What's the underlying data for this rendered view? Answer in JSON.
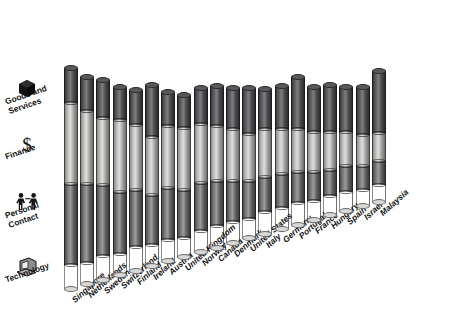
{
  "legend": {
    "items": [
      {
        "label": "Goods and\nServices",
        "icon": "cube-icon",
        "color": "#4a4a4d",
        "key": "goods"
      },
      {
        "label": "Finance",
        "icon": "dollar-sign-icon",
        "color": "#cfcfcd",
        "key": "finance"
      },
      {
        "label": "Personal\nContact",
        "icon": "two-people-icon",
        "color": "#8a8a8c",
        "key": "personal"
      },
      {
        "label": "Technology",
        "icon": "computer-icon",
        "color": "#eaeae7",
        "key": "technology"
      }
    ]
  },
  "chart_data": {
    "type": "bar",
    "title": "",
    "xlabel": "",
    "ylabel": "",
    "stacked": true,
    "grid": false,
    "legend_position": "left",
    "ylim": [
      0,
      100
    ],
    "categories": [
      "Singapore",
      "Netherlands",
      "Sweden",
      "Switzerland",
      "Finland",
      "Ireland",
      "Austria",
      "United Kingdom",
      "Norway",
      "Canada",
      "Denmark",
      "United States",
      "Italy",
      "Germany",
      "Portugal",
      "France",
      "Hungary",
      "Spain",
      "Israel",
      "Malaysia"
    ],
    "series": [
      {
        "name": "Goods and Services",
        "key": "goods",
        "color": "#4a4a4d",
        "values": [
          15,
          14,
          16,
          14,
          15,
          22,
          14,
          14,
          15,
          17,
          17,
          19,
          17,
          18,
          22,
          19,
          20,
          19,
          20,
          26
        ]
      },
      {
        "name": "Finance",
        "key": "finance",
        "color": "#cfcfcd",
        "values": [
          34,
          31,
          28,
          30,
          27,
          24,
          26,
          26,
          25,
          23,
          22,
          20,
          20,
          19,
          18,
          17,
          16,
          14,
          13,
          12
        ]
      },
      {
        "name": "Personal Contact",
        "key": "personal",
        "color": "#8a8a8c",
        "values": [
          34,
          33,
          30,
          26,
          24,
          21,
          22,
          20,
          20,
          19,
          17,
          16,
          15,
          14,
          13,
          12,
          11,
          11,
          10,
          10
        ]
      },
      {
        "name": "Technology",
        "key": "technology",
        "color": "#eaeae7",
        "values": [
          10,
          9,
          10,
          9,
          10,
          9,
          9,
          8,
          9,
          9,
          9,
          8,
          9,
          9,
          9,
          8,
          8,
          8,
          7,
          7
        ]
      }
    ],
    "totals": [
      93,
      87,
      84,
      79,
      76,
      76,
      71,
      68,
      69,
      68,
      65,
      63,
      61,
      60,
      62,
      56,
      55,
      52,
      50,
      55
    ]
  }
}
